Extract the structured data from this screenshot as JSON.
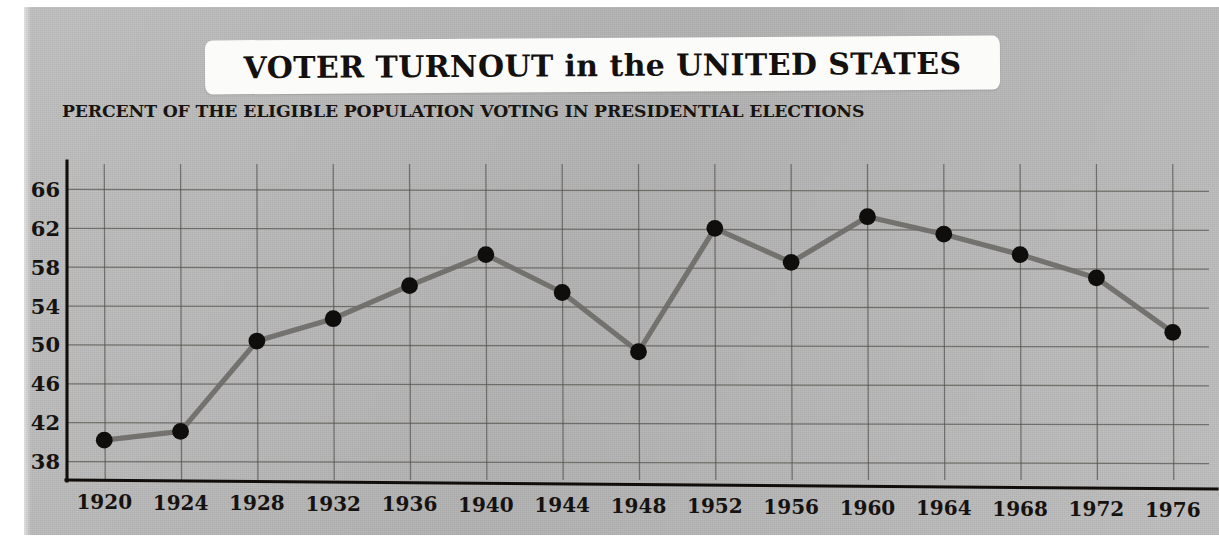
{
  "title": "VOTER TURNOUT in the UNITED STATES",
  "subtitle": "PERCENT OF THE ELIGIBLE POPULATION VOTING IN PRESIDENTIAL ELECTIONS",
  "colors": {
    "plate_background": "#b9b9b9",
    "banner_background": "#fbfbfa",
    "text": "#16120f",
    "gridline": "#57544f",
    "axis": "#100d0b",
    "line": "#6f6d69",
    "marker": "#100e0c"
  },
  "chart_data": {
    "type": "line",
    "title": "VOTER TURNOUT in the UNITED STATES",
    "subtitle": "PERCENT OF THE ELIGIBLE POPULATION VOTING IN PRESIDENTIAL ELECTIONS",
    "xlabel": "",
    "ylabel": "",
    "x": [
      1920,
      1924,
      1928,
      1932,
      1936,
      1940,
      1944,
      1948,
      1952,
      1956,
      1960,
      1964,
      1968,
      1972,
      1976
    ],
    "categories": [
      "1920",
      "1924",
      "1928",
      "1932",
      "1936",
      "1940",
      "1944",
      "1948",
      "1952",
      "1956",
      "1960",
      "1964",
      "1968",
      "1972",
      "1976"
    ],
    "values": [
      40.2,
      41.1,
      50.4,
      52.7,
      56.1,
      59.3,
      55.4,
      49.3,
      62.0,
      58.5,
      63.2,
      61.4,
      59.3,
      56.9,
      51.3
    ],
    "series": [
      {
        "name": "Percent of eligible population voting",
        "values": [
          40.2,
          41.1,
          50.4,
          52.7,
          56.1,
          59.3,
          55.4,
          49.3,
          62.0,
          58.5,
          63.2,
          61.4,
          59.3,
          56.9,
          51.3
        ]
      }
    ],
    "xtick_labels": [
      "1920",
      "1924",
      "1928",
      "1932",
      "1936",
      "1940",
      "1944",
      "1948",
      "1952",
      "1956",
      "1960",
      "1964",
      "1968",
      "1972",
      "1976"
    ],
    "ytick_labels": [
      "66",
      "62",
      "58",
      "54",
      "50",
      "46",
      "42",
      "38"
    ],
    "yticks": [
      66,
      62,
      58,
      54,
      50,
      46,
      42,
      38
    ],
    "ylim": [
      36.1,
      67.8
    ],
    "xlim": [
      1918.1,
      1977.9
    ],
    "grid": true,
    "legend": false,
    "markers": "filled-circle"
  }
}
